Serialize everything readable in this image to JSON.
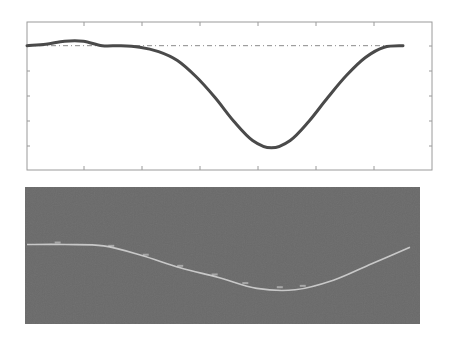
{
  "colors": {
    "page_background": "#ffffff",
    "top_axes_frame": "#9a9a9a",
    "top_curve": "#4a4a4a",
    "reference_line": "#8a8a8a",
    "bottom_background": "#6b6b6b",
    "bottom_curve": "#d8d8d8"
  },
  "chart_data": [
    {
      "type": "line",
      "title": "",
      "xlabel": "",
      "ylabel": "",
      "grid": false,
      "legend": null,
      "x_ticks_count": 7,
      "y_ticks_count": 6,
      "xlim": [
        0,
        1
      ],
      "ylim": [
        0,
        1
      ],
      "series": [
        {
          "name": "signal",
          "style": "solid thick dark gray",
          "x": [
            0.0,
            0.05,
            0.1,
            0.15,
            0.2,
            0.25,
            0.3,
            0.35,
            0.4,
            0.45,
            0.5,
            0.55,
            0.6,
            0.65,
            0.7,
            0.75,
            0.8,
            0.85,
            0.9,
            0.95,
            1.0
          ],
          "y": [
            0.84,
            0.85,
            0.87,
            0.87,
            0.84,
            0.84,
            0.83,
            0.8,
            0.74,
            0.63,
            0.49,
            0.33,
            0.2,
            0.15,
            0.2,
            0.33,
            0.49,
            0.64,
            0.76,
            0.83,
            0.84
          ]
        },
        {
          "name": "reference",
          "style": "dash-dot horizontal",
          "x": [
            0.0,
            1.0
          ],
          "y": [
            0.84,
            0.84
          ]
        }
      ]
    },
    {
      "type": "line",
      "title": "",
      "xlabel": "",
      "ylabel": "",
      "grid": false,
      "legend": null,
      "background": "dark noisy gray image",
      "xlim": [
        0,
        1
      ],
      "ylim": [
        0,
        1
      ],
      "series": [
        {
          "name": "traced-signal",
          "style": "thin light line on dark background",
          "x": [
            0.0,
            0.1,
            0.2,
            0.3,
            0.4,
            0.5,
            0.6,
            0.7,
            0.8,
            0.9,
            1.0
          ],
          "y": [
            0.58,
            0.58,
            0.57,
            0.5,
            0.41,
            0.34,
            0.26,
            0.25,
            0.32,
            0.44,
            0.56
          ]
        }
      ]
    }
  ]
}
